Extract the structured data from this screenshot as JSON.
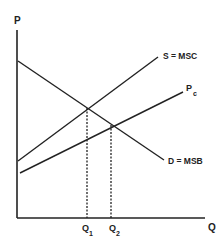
{
  "diagram": {
    "type": "externality-supply-demand",
    "axes": {
      "y_label": "P",
      "x_label": "Q"
    },
    "curves": {
      "supply": {
        "label": "S = MSC",
        "x1": 18,
        "y1": 161,
        "x2": 158,
        "y2": 57
      },
      "private_cost": {
        "label": "P",
        "subscript": "c",
        "x1": 20,
        "y1": 173,
        "x2": 183,
        "y2": 92
      },
      "demand": {
        "label": "D = MSB",
        "x1": 18,
        "y1": 61,
        "x2": 164,
        "y2": 160
      }
    },
    "quantities": [
      {
        "label": "Q",
        "subscript": "1",
        "x": 87,
        "y_top": 108
      },
      {
        "label": "Q",
        "subscript": "2",
        "x": 111,
        "y_top": 125
      }
    ],
    "colors": {
      "line": "#222222",
      "background": "#ffffff"
    }
  }
}
